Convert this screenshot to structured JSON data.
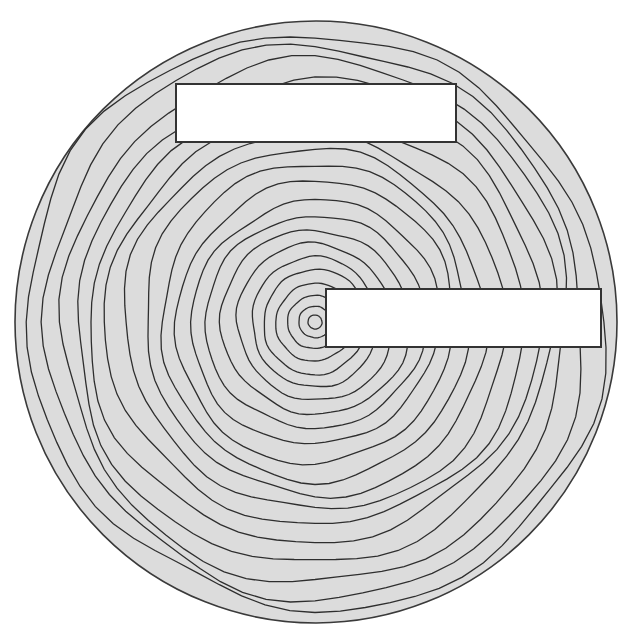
{
  "diagram": {
    "type": "concentric-contours",
    "background": "#ffffff",
    "disc": {
      "cx": 316,
      "cy": 322,
      "r": 301,
      "fill": "#dcdcdc",
      "stroke": "#3a3a3a"
    },
    "center": {
      "cx": 315,
      "cy": 322
    },
    "contour_color": "#2e2e2e",
    "ring_radii": [
      7,
      16,
      27,
      39,
      52,
      64,
      78,
      93,
      108,
      123,
      140,
      156,
      172,
      189,
      206,
      223,
      240,
      257,
      273,
      288
    ],
    "rectangles": [
      {
        "name": "top-label-box",
        "x": 176,
        "y": 84,
        "width": 280,
        "height": 58,
        "fill": "#ffffff",
        "stroke": "#333333"
      },
      {
        "name": "right-label-box",
        "x": 326,
        "y": 289,
        "width": 275,
        "height": 58,
        "fill": "#ffffff",
        "stroke": "#333333"
      }
    ]
  }
}
